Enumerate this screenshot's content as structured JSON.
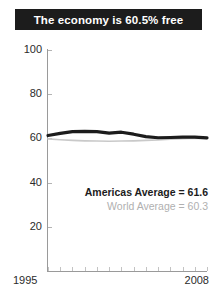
{
  "title": {
    "text": "The economy is 60.5% free"
  },
  "legend": {
    "americas_label": "Americas Average = 61.6",
    "world_label": "World Average = 60.3"
  },
  "axis": {
    "x_start_label": "1995",
    "x_end_label": "2008",
    "y_labels": [
      "100",
      "80",
      "60",
      "40",
      "20"
    ]
  },
  "colors": {
    "banner_bg": "#1c1c1c",
    "banner_text": "#ffffff",
    "americas_line": "#1c1c1c",
    "world_line": "#c9c9c9",
    "axis": "#9a9a9a",
    "tick_text": "#2b2b2b",
    "legend_world_text": "#b0b0b0"
  },
  "chart_data": {
    "type": "line",
    "title": "The economy is 60.5% free",
    "xlabel": "",
    "ylabel": "",
    "xlim": [
      1995,
      2008
    ],
    "ylim": [
      0,
      100
    ],
    "yticks": [
      20,
      40,
      60,
      80,
      100
    ],
    "grid": false,
    "legend_position": "inside-lower-right",
    "x": [
      1995,
      1996,
      1997,
      1998,
      1999,
      2000,
      2001,
      2002,
      2003,
      2004,
      2005,
      2006,
      2007,
      2008
    ],
    "series": [
      {
        "name": "Americas Average",
        "average": 61.6,
        "color": "#1c1c1c",
        "values": [
          61.3,
          62.3,
          63.1,
          63.2,
          63.1,
          62.4,
          62.8,
          61.9,
          60.8,
          60.3,
          60.4,
          60.6,
          60.6,
          60.2
        ]
      },
      {
        "name": "World Average",
        "average": 60.3,
        "color": "#c9c9c9",
        "values": [
          59.8,
          59.4,
          59.1,
          58.9,
          58.8,
          58.7,
          58.8,
          58.9,
          59.1,
          59.3,
          59.6,
          59.9,
          60.1,
          60.0
        ]
      }
    ],
    "annotations": [
      "Americas Average = 61.6",
      "World Average = 60.3"
    ]
  }
}
